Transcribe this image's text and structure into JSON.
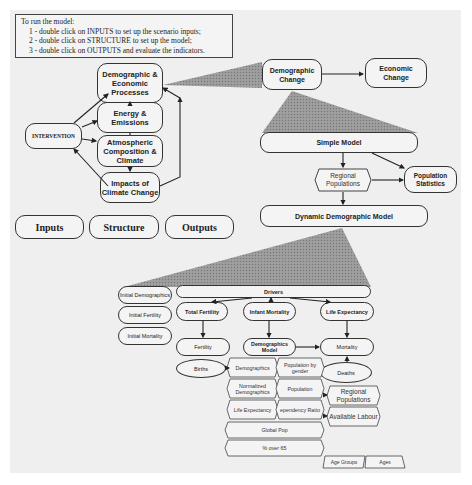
{
  "instructions": {
    "title": "To run the model:",
    "steps": [
      "1 - double click on INPUTS to set up the scenario inputs;",
      "2 - double click on STRUCTURE to set up the model;",
      "3 - double click on OUTPUTS and evaluate the indicators."
    ]
  },
  "top_level": {
    "demographic_economic": "Demographic & Economic Processes",
    "energy": "Energy & Emissions",
    "atmospheric": "Atmospheric Composition & Climate",
    "impacts": "Impacts of Climate Change",
    "intervention": "INTERVENTION"
  },
  "nav_buttons": {
    "inputs": "Inputs",
    "structure": "Structure",
    "outputs": "Outputs"
  },
  "level2": {
    "demographic_change": "Demographic Change",
    "economic_change": "Economic Change"
  },
  "level3": {
    "simple_model": "Simple Model",
    "regional_populations": "Regional Populations",
    "population_statistics": "Population Statistics",
    "dynamic_model": "Dynamic Demographic Model"
  },
  "level4": {
    "initial_demographics": "Initial Demographics",
    "initial_fertility": "Initial Fertility",
    "initial_mortality": "Initial Mortality",
    "drivers": "Drivers",
    "total_fertility": "Total Fertility",
    "infant_mortality": "Infant Mortality",
    "life_expectancy": "Life Expectancy",
    "fertility": "Fertility",
    "demographics_model": "Demographics Model",
    "mortality": "Mortality",
    "births": "Births",
    "deaths": "Deaths",
    "demographics": "Demographics",
    "population_by_gender": "Population by gender",
    "normalized_demographics": "Normalized Demographics",
    "population": "Population",
    "life_expectancy_out": "Life Expectancy",
    "dependency_ratio": "ependency Ratio",
    "regional_populations": "Regional Populations",
    "available_labour": "Available Labour",
    "global_pop": "Global Pop",
    "pct_over_65": "% over 65",
    "age_groups": "Age Groups",
    "ages": "Ages"
  },
  "colors": {
    "canvas": "#efefef",
    "box_fill": "#f4f4f4",
    "stroke": "#333333",
    "zoom_wedge": "#8a8a8a"
  }
}
